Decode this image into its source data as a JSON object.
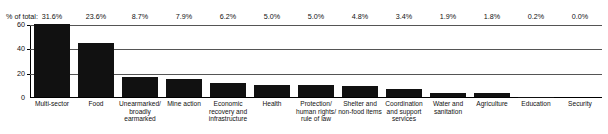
{
  "chart_data": {
    "type": "bar",
    "title": "",
    "subtitle": "",
    "xlabel": "",
    "ylabel": "",
    "ylim": [
      0,
      60
    ],
    "yticks": [
      "0",
      "20",
      "40",
      "60"
    ],
    "ytick_values": [
      0,
      20,
      40,
      60
    ],
    "grid": true,
    "legend": false,
    "bar_color": "#111111",
    "annotation_row_label": "% of total:",
    "categories": [
      "Multi-sector",
      "Food",
      "Unearmarked/ broadly earmarked",
      "Mine action",
      "Economic recovery and infrastructure",
      "Health",
      "Protection/ human rights/ rule of law",
      "Shelter and non-food items",
      "Coordination and support services",
      "Water and sanitation",
      "Agriculture",
      "Education",
      "Security"
    ],
    "percent_of_total": [
      "31.6%",
      "23.6%",
      "8.7%",
      "7.9%",
      "6.2%",
      "5.0%",
      "5.0%",
      "4.8%",
      "3.4%",
      "1.9%",
      "1.8%",
      "0.2%",
      "0.0%"
    ],
    "values": [
      60.0,
      44.8,
      16.5,
      15.0,
      11.8,
      9.5,
      9.5,
      9.1,
      6.5,
      3.6,
      3.4,
      0.4,
      0.0
    ]
  }
}
